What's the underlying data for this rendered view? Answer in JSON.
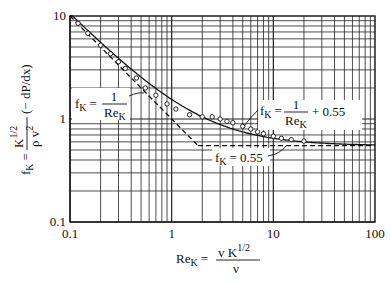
{
  "chart_data": {
    "type": "line",
    "title": "",
    "xscale": "log",
    "yscale": "log",
    "xlim": [
      0.1,
      100
    ],
    "ylim": [
      0.1,
      10
    ],
    "xticks": [
      "0.1",
      "1",
      "10",
      "100"
    ],
    "yticks": [
      "0.1",
      "1",
      "10"
    ],
    "xlabel": "Re_K = v K^1/2 / ν",
    "ylabel": "f_K = (K^1/2 / ρ v^2)(−dP/dx)",
    "grid": true,
    "series": [
      {
        "name": "f_K = 1/Re_K + 0.55",
        "style": "solid",
        "x": [
          0.1,
          0.2,
          0.5,
          1,
          2,
          5,
          10,
          20,
          50,
          100
        ],
        "y": [
          10.55,
          5.55,
          2.55,
          1.55,
          1.05,
          0.75,
          0.65,
          0.6,
          0.57,
          0.56
        ]
      },
      {
        "name": "f_K = 1/Re_K",
        "style": "dashed",
        "x": [
          0.1,
          1.82
        ],
        "y": [
          10,
          0.55
        ]
      },
      {
        "name": "f_K = 0.55",
        "style": "dashed",
        "x": [
          1.82,
          100
        ],
        "y": [
          0.55,
          0.55
        ]
      },
      {
        "name": "experimental data",
        "style": "markers",
        "x": [
          0.12,
          0.15,
          0.2,
          0.25,
          0.3,
          0.35,
          0.45,
          0.55,
          0.7,
          0.9,
          1.1,
          1.5,
          2,
          2.5,
          3,
          3.5,
          4,
          5,
          6,
          7,
          8,
          10,
          12,
          15,
          20
        ],
        "y": [
          8.5,
          6.8,
          5.2,
          4.3,
          3.6,
          3.1,
          2.5,
          2.0,
          1.7,
          1.4,
          1.25,
          1.1,
          1.05,
          1.05,
          1.0,
          0.95,
          0.92,
          0.85,
          0.8,
          0.75,
          0.72,
          0.68,
          0.65,
          0.63,
          0.61
        ]
      }
    ],
    "annotations": [
      {
        "text": "f_K = 1/Re_K",
        "at": [
          0.2,
          1.3
        ]
      },
      {
        "text": "f_K = 1/Re_K + 0.55",
        "at": [
          6,
          1.1
        ]
      },
      {
        "text": "f_K = 0.55",
        "at": [
          2.5,
          0.4
        ]
      }
    ]
  },
  "labels": {
    "fK": "f",
    "K": "K",
    "eq": "=",
    "one": "1",
    "ReK": "Re",
    "plus055": "+ 0.55",
    "val055": "0.55",
    "xlabel_lhs": "Re",
    "xlabel_num": "v K",
    "xlabel_exp": "1/2",
    "xlabel_den": "ν",
    "ylabel_num": "K",
    "ylabel_exp": "1/2",
    "ylabel_den": "ρ v",
    "ylabel_den_exp": "2",
    "ylabel_paren": "(− dP/dx)"
  }
}
